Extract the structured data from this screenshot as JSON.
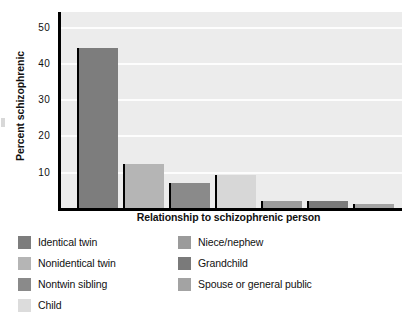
{
  "chart_data": {
    "type": "bar",
    "title": "",
    "xlabel": "Relationship to schizophrenic person",
    "ylabel": "Percent schizophrenic",
    "categories": [
      "Identical twin",
      "Nonidentical twin",
      "Nontwin sibling",
      "Child",
      "Niece/nephew",
      "Grandchild",
      "Spouse or general public"
    ],
    "values": [
      44,
      12,
      7,
      9,
      2,
      2,
      1
    ],
    "ylim": [
      0,
      54
    ],
    "yticks": [
      10,
      20,
      30,
      40,
      50
    ],
    "ytick_labels": [
      "10",
      "20",
      "30",
      "40",
      "50"
    ],
    "grid": true,
    "legend_position": "below-two-columns",
    "bar_colors": [
      "#7d7d7d",
      "#b5b5b5",
      "#8a8a8a",
      "#d7d7d7",
      "#9b9b9b",
      "#7a7a7a",
      "#a3a3a3"
    ]
  },
  "axes": {
    "y_title": "Percent schizophrenic",
    "x_title": "Relationship to schizophrenic person",
    "tick_labels": [
      "50",
      "40",
      "30",
      "20",
      "10"
    ]
  },
  "legend": {
    "left_column": [
      {
        "label": "Identical twin",
        "color": "#7d7d7d"
      },
      {
        "label": "Nonidentical twin",
        "color": "#b5b5b5"
      },
      {
        "label": "Nontwin sibling",
        "color": "#8a8a8a"
      },
      {
        "label": "Child",
        "color": "#dcdcdc"
      }
    ],
    "right_column": [
      {
        "label": "Niece/nephew",
        "color": "#9b9b9b"
      },
      {
        "label": "Grandchild",
        "color": "#7a7a7a"
      },
      {
        "label": "Spouse or general public",
        "color": "#a3a3a3"
      }
    ]
  },
  "style": {
    "plot_background": "#ececec",
    "gridline_color": "#fdfdfd",
    "axis_color": "#000000",
    "text_color": "#111111"
  }
}
